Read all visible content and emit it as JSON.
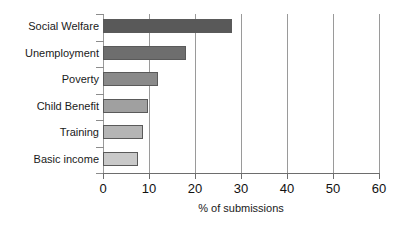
{
  "chart_data": {
    "type": "bar",
    "orientation": "horizontal",
    "title": "",
    "xlabel": "% of submissions",
    "ylabel": "",
    "categories": [
      "Social Welfare",
      "Unemployment",
      "Poverty",
      "Child Benefit",
      "Training",
      "Basic income"
    ],
    "values": [
      28,
      18,
      12,
      9.7,
      8.7,
      7.6
    ],
    "series": [
      {
        "name": "% of submissions",
        "values": [
          28,
          18,
          12,
          9.7,
          8.7,
          7.6
        ]
      }
    ],
    "bar_colors": [
      "#595959",
      "#6e6e6e",
      "#8a8a8a",
      "#a0a0a0",
      "#b5b5b5",
      "#c9c9c9"
    ],
    "bar_border_color": "#5a5a5a",
    "xlim": [
      0,
      60
    ],
    "xticks": [
      0,
      10,
      20,
      30,
      40,
      50,
      60
    ],
    "xtick_labels": [
      "0",
      "10",
      "20",
      "30",
      "40",
      "50",
      "60"
    ],
    "grid": "vertical",
    "gridline_color": "#9a9a9a",
    "axis_color": "#6d6d6d",
    "legend": "none",
    "background": "#ffffff"
  }
}
